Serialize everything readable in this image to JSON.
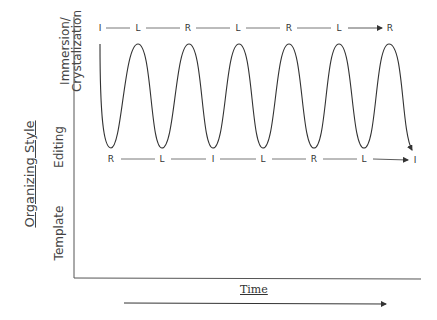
{
  "diagram": {
    "type": "oscillation-diagram",
    "y_axis": {
      "title": "Organizing Style",
      "levels": [
        "Immersion/\nCrystalization",
        "Editing",
        "Template"
      ],
      "level_line1": "Immersion/",
      "level_line2": "Crystalization",
      "editing": "Editing",
      "template": "Template"
    },
    "x_axis": {
      "title": "Time"
    },
    "top_sequence": [
      "I",
      "L",
      "R",
      "L",
      "R",
      "L",
      "R"
    ],
    "bottom_sequence": [
      "R",
      "L",
      "I",
      "L",
      "R",
      "L",
      "I"
    ],
    "curve": {
      "peaks": 6,
      "troughs": 6,
      "ends_with_arrow": true
    },
    "colors": {
      "line": "#333333",
      "background": "#ffffff"
    }
  }
}
